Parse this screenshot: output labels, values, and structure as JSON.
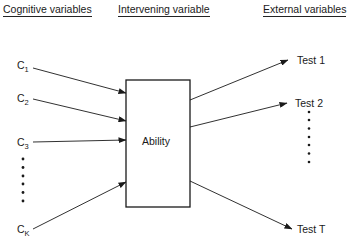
{
  "headers": {
    "cognitive": "Cognitive variables",
    "intervening": "Intervening variable",
    "external": "External variables"
  },
  "center_box": {
    "label": "Ability"
  },
  "inputs": [
    {
      "base": "C",
      "sub": "1"
    },
    {
      "base": "C",
      "sub": "2"
    },
    {
      "base": "C",
      "sub": "3"
    },
    {
      "base": "C",
      "sub": "K"
    }
  ],
  "outputs": [
    {
      "label": "Test 1"
    },
    {
      "label": "Test 2"
    },
    {
      "label": "Test T"
    }
  ],
  "ellipsis": {
    "left_dot_count": 6,
    "right_dot_count": 7
  },
  "colors": {
    "ink": "#1a1a1a",
    "background": "#ffffff"
  }
}
